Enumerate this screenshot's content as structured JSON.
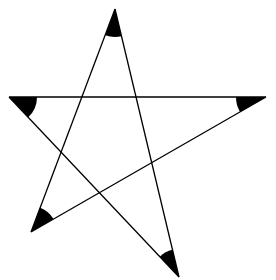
{
  "diagram": {
    "type": "pentagram",
    "stroke_color": "#000000",
    "fill_color": "#000000",
    "background": "#ffffff",
    "vertices": {
      "top": [
        115,
        9
      ],
      "left": [
        9,
        97
      ],
      "right": [
        266,
        97
      ],
      "bottom_left": [
        31,
        232
      ],
      "bottom_right": [
        179,
        277
      ]
    },
    "edges": [
      {
        "from": "top",
        "to": "bottom_left"
      },
      {
        "from": "top",
        "to": "bottom_right"
      },
      {
        "from": "left",
        "to": "right"
      },
      {
        "from": "left",
        "to": "bottom_right"
      },
      {
        "from": "right",
        "to": "bottom_left"
      }
    ],
    "angle_markers": [
      {
        "vertex": "top",
        "radius": 28
      },
      {
        "vertex": "left",
        "radius": 28
      },
      {
        "vertex": "right",
        "radius": 30
      },
      {
        "vertex": "bottom_left",
        "radius": 26
      },
      {
        "vertex": "bottom_right",
        "radius": 28
      }
    ]
  }
}
